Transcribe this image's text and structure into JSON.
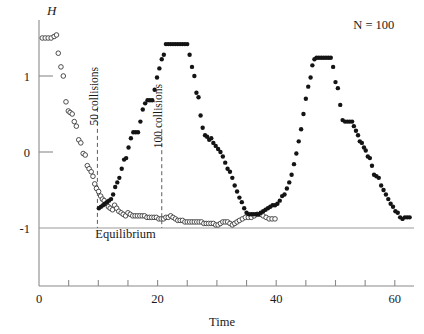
{
  "figure": {
    "y_axis_label": "H",
    "x_axis_label": "Time",
    "legend_note": "N = 100",
    "equilibrium_label": "Equilibrium",
    "annotation_1": "50 collisions",
    "annotation_2": "100 collisions"
  },
  "colors": {
    "axis": "#8a8a8a",
    "filled_marker": "#141414",
    "open_marker_stroke": "#3a3a3a",
    "open_marker_fill": "#ffffff",
    "equilibrium_line": "#9a9a9a",
    "annotation_line": "#4a4a4a",
    "background": "#ffffff"
  },
  "chart_data": {
    "type": "scatter",
    "title": "",
    "subtitle": "",
    "xlabel": "Time",
    "ylabel": "H",
    "xlim": [
      0,
      64
    ],
    "ylim": [
      -1.35,
      1.75
    ],
    "grid": false,
    "legend_position": "top-right",
    "annotations": [
      {
        "text": "N = 100",
        "x": 53,
        "y": 1.62,
        "kind": "note"
      },
      {
        "text": "Equilibrium",
        "x": 9.5,
        "y": -1.13,
        "kind": "label"
      },
      {
        "text": "50 collisions",
        "x": 10.0,
        "y": 0.35,
        "kind": "vline-label",
        "rotation": -90
      },
      {
        "text": "100 collisions",
        "x": 20.8,
        "y": 0.05,
        "kind": "vline-label",
        "rotation": -90
      }
    ],
    "reference_lines": [
      {
        "name": "equilibrium",
        "orientation": "horizontal",
        "value": -1.0,
        "style": "solid"
      },
      {
        "name": "50 collisions",
        "orientation": "vertical",
        "value": 9.85,
        "style": "dashed",
        "y_from": -1.0,
        "y_to": 0.58
      },
      {
        "name": "100 collisions",
        "orientation": "vertical",
        "value": 20.7,
        "style": "dashed",
        "y_from": -1.0,
        "y_to": 0.3
      }
    ],
    "x_ticks": [
      0,
      5,
      10,
      15,
      20,
      25,
      30,
      35,
      40,
      45,
      50,
      55,
      60
    ],
    "x_tick_labels": {
      "0": "0",
      "20": "20",
      "40": "40",
      "60": "60"
    },
    "y_ticks": [
      -1,
      0,
      1
    ],
    "y_tick_labels": {
      "-1": "-1",
      "0": "0",
      "1": "1"
    },
    "series": [
      {
        "name": "open-circles",
        "marker": "open-circle",
        "points": [
          [
            0.55,
            1.5
          ],
          [
            1.05,
            1.5
          ],
          [
            1.55,
            1.5
          ],
          [
            2.05,
            1.5
          ],
          [
            2.55,
            1.52
          ],
          [
            2.95,
            1.54
          ],
          [
            3.25,
            1.3
          ],
          [
            3.7,
            1.12
          ],
          [
            4.1,
            1.0
          ],
          [
            4.55,
            0.66
          ],
          [
            4.95,
            0.54
          ],
          [
            5.25,
            0.52
          ],
          [
            5.6,
            0.5
          ],
          [
            5.95,
            0.4
          ],
          [
            6.3,
            0.34
          ],
          [
            6.7,
            0.16
          ],
          [
            7.05,
            0.12
          ],
          [
            7.45,
            -0.02
          ],
          [
            7.8,
            -0.04
          ],
          [
            8.15,
            -0.18
          ],
          [
            8.45,
            -0.22
          ],
          [
            8.8,
            -0.26
          ],
          [
            9.1,
            -0.32
          ],
          [
            9.4,
            -0.42
          ],
          [
            9.7,
            -0.48
          ],
          [
            10.05,
            -0.52
          ],
          [
            10.4,
            -0.58
          ],
          [
            10.7,
            -0.62
          ],
          [
            11.0,
            -0.64
          ],
          [
            11.35,
            -0.68
          ],
          [
            11.7,
            -0.72
          ],
          [
            12.0,
            -0.74
          ],
          [
            12.4,
            -0.76
          ],
          [
            12.75,
            -0.7
          ],
          [
            13.1,
            -0.74
          ],
          [
            13.45,
            -0.78
          ],
          [
            13.85,
            -0.8
          ],
          [
            14.2,
            -0.82
          ],
          [
            14.6,
            -0.84
          ],
          [
            15.0,
            -0.8
          ],
          [
            15.4,
            -0.82
          ],
          [
            15.8,
            -0.84
          ],
          [
            16.2,
            -0.84
          ],
          [
            16.6,
            -0.84
          ],
          [
            17.0,
            -0.84
          ],
          [
            17.4,
            -0.84
          ],
          [
            17.8,
            -0.84
          ],
          [
            18.2,
            -0.86
          ],
          [
            18.6,
            -0.86
          ],
          [
            19.0,
            -0.86
          ],
          [
            19.4,
            -0.86
          ],
          [
            19.8,
            -0.86
          ],
          [
            20.2,
            -0.88
          ],
          [
            20.6,
            -0.88
          ],
          [
            21.0,
            -0.88
          ],
          [
            21.4,
            -0.86
          ],
          [
            21.8,
            -0.86
          ],
          [
            22.2,
            -0.84
          ],
          [
            22.6,
            -0.86
          ],
          [
            23.0,
            -0.88
          ],
          [
            23.4,
            -0.9
          ],
          [
            23.8,
            -0.9
          ],
          [
            24.2,
            -0.9
          ],
          [
            24.6,
            -0.92
          ],
          [
            25.0,
            -0.92
          ],
          [
            25.4,
            -0.92
          ],
          [
            25.8,
            -0.92
          ],
          [
            26.2,
            -0.92
          ],
          [
            26.6,
            -0.92
          ],
          [
            27.0,
            -0.92
          ],
          [
            27.4,
            -0.92
          ],
          [
            27.8,
            -0.94
          ],
          [
            28.2,
            -0.94
          ],
          [
            28.6,
            -0.94
          ],
          [
            29.0,
            -0.94
          ],
          [
            29.4,
            -0.94
          ],
          [
            29.8,
            -0.96
          ],
          [
            30.2,
            -0.96
          ],
          [
            30.6,
            -0.94
          ],
          [
            31.0,
            -0.92
          ],
          [
            31.4,
            -0.92
          ],
          [
            31.8,
            -0.92
          ],
          [
            32.2,
            -0.94
          ],
          [
            32.6,
            -0.96
          ],
          [
            33.0,
            -0.94
          ],
          [
            33.4,
            -0.92
          ],
          [
            33.8,
            -0.9
          ],
          [
            34.3,
            -0.88
          ],
          [
            34.8,
            -0.86
          ],
          [
            35.3,
            -0.86
          ],
          [
            35.8,
            -0.86
          ],
          [
            36.3,
            -0.84
          ],
          [
            36.8,
            -0.82
          ],
          [
            37.3,
            -0.82
          ],
          [
            37.8,
            -0.84
          ],
          [
            38.3,
            -0.86
          ],
          [
            38.8,
            -0.88
          ],
          [
            39.3,
            -0.88
          ],
          [
            39.8,
            -0.88
          ]
        ]
      },
      {
        "name": "filled-circles",
        "marker": "filled-circle",
        "points": [
          [
            10.1,
            -0.74
          ],
          [
            10.45,
            -0.72
          ],
          [
            10.8,
            -0.7
          ],
          [
            11.1,
            -0.68
          ],
          [
            11.45,
            -0.66
          ],
          [
            11.8,
            -0.64
          ],
          [
            12.15,
            -0.62
          ],
          [
            12.5,
            -0.56
          ],
          [
            12.85,
            -0.46
          ],
          [
            13.2,
            -0.4
          ],
          [
            13.55,
            -0.34
          ],
          [
            13.95,
            -0.22
          ],
          [
            14.35,
            -0.1
          ],
          [
            14.7,
            -0.08
          ],
          [
            15.1,
            0.06
          ],
          [
            15.5,
            0.18
          ],
          [
            15.9,
            0.26
          ],
          [
            16.3,
            0.26
          ],
          [
            16.7,
            0.26
          ],
          [
            17.1,
            0.4
          ],
          [
            17.5,
            0.56
          ],
          [
            17.9,
            0.64
          ],
          [
            18.3,
            0.68
          ],
          [
            18.7,
            0.68
          ],
          [
            19.1,
            0.68
          ],
          [
            19.5,
            0.82
          ],
          [
            19.9,
            0.98
          ],
          [
            20.3,
            1.1
          ],
          [
            20.7,
            1.22
          ],
          [
            21.05,
            1.28
          ],
          [
            21.4,
            1.42
          ],
          [
            21.8,
            1.42
          ],
          [
            22.2,
            1.42
          ],
          [
            22.6,
            1.42
          ],
          [
            23.0,
            1.42
          ],
          [
            23.4,
            1.42
          ],
          [
            23.8,
            1.42
          ],
          [
            24.2,
            1.42
          ],
          [
            24.6,
            1.42
          ],
          [
            25.0,
            1.42
          ],
          [
            25.4,
            1.28
          ],
          [
            25.8,
            1.12
          ],
          [
            26.2,
            1.0
          ],
          [
            26.55,
            0.78
          ],
          [
            26.9,
            0.72
          ],
          [
            27.25,
            0.48
          ],
          [
            27.6,
            0.32
          ],
          [
            28.0,
            0.22
          ],
          [
            28.35,
            0.2
          ],
          [
            28.7,
            0.16
          ],
          [
            29.05,
            0.18
          ],
          [
            29.4,
            0.12
          ],
          [
            29.8,
            0.08
          ],
          [
            30.2,
            0.04
          ],
          [
            30.6,
            0.0
          ],
          [
            31.0,
            -0.06
          ],
          [
            31.4,
            -0.14
          ],
          [
            31.8,
            -0.22
          ],
          [
            32.2,
            -0.26
          ],
          [
            32.6,
            -0.34
          ],
          [
            33.0,
            -0.44
          ],
          [
            33.4,
            -0.52
          ],
          [
            33.8,
            -0.6
          ],
          [
            34.2,
            -0.66
          ],
          [
            34.6,
            -0.74
          ],
          [
            35.0,
            -0.8
          ],
          [
            35.4,
            -0.82
          ],
          [
            35.8,
            -0.82
          ],
          [
            36.2,
            -0.82
          ],
          [
            36.6,
            -0.82
          ],
          [
            37.0,
            -0.82
          ],
          [
            37.4,
            -0.8
          ],
          [
            37.8,
            -0.78
          ],
          [
            38.2,
            -0.76
          ],
          [
            38.6,
            -0.74
          ],
          [
            39.0,
            -0.72
          ],
          [
            39.4,
            -0.7
          ],
          [
            39.8,
            -0.7
          ],
          [
            40.2,
            -0.68
          ],
          [
            40.6,
            -0.64
          ],
          [
            41.0,
            -0.58
          ],
          [
            41.4,
            -0.56
          ],
          [
            41.8,
            -0.48
          ],
          [
            42.2,
            -0.4
          ],
          [
            42.6,
            -0.3
          ],
          [
            43.0,
            -0.16
          ],
          [
            43.4,
            -0.02
          ],
          [
            43.8,
            0.14
          ],
          [
            44.2,
            0.3
          ],
          [
            44.6,
            0.5
          ],
          [
            45.0,
            0.7
          ],
          [
            45.4,
            0.86
          ],
          [
            45.8,
            0.98
          ],
          [
            46.1,
            1.14
          ],
          [
            46.45,
            1.22
          ],
          [
            46.8,
            1.24
          ],
          [
            47.2,
            1.24
          ],
          [
            47.6,
            1.24
          ],
          [
            48.0,
            1.24
          ],
          [
            48.4,
            1.24
          ],
          [
            48.8,
            1.24
          ],
          [
            49.2,
            1.24
          ],
          [
            49.6,
            1.12
          ],
          [
            50.0,
            0.92
          ],
          [
            50.4,
            0.84
          ],
          [
            50.8,
            0.62
          ],
          [
            51.2,
            0.42
          ],
          [
            51.6,
            0.4
          ],
          [
            52.0,
            0.4
          ],
          [
            52.4,
            0.4
          ],
          [
            52.8,
            0.4
          ],
          [
            53.1,
            0.34
          ],
          [
            53.45,
            0.28
          ],
          [
            53.8,
            0.22
          ],
          [
            54.1,
            0.14
          ],
          [
            54.45,
            0.12
          ],
          [
            54.8,
            0.06
          ],
          [
            55.1,
            0.02
          ],
          [
            55.45,
            -0.06
          ],
          [
            55.8,
            -0.08
          ],
          [
            56.15,
            -0.18
          ],
          [
            56.5,
            -0.3
          ],
          [
            56.9,
            -0.32
          ],
          [
            57.3,
            -0.34
          ],
          [
            57.7,
            -0.44
          ],
          [
            58.1,
            -0.5
          ],
          [
            58.5,
            -0.56
          ],
          [
            58.9,
            -0.62
          ],
          [
            59.3,
            -0.68
          ],
          [
            59.7,
            -0.72
          ],
          [
            60.1,
            -0.78
          ],
          [
            60.5,
            -0.8
          ],
          [
            60.9,
            -0.86
          ],
          [
            61.3,
            -0.88
          ],
          [
            61.7,
            -0.86
          ],
          [
            62.1,
            -0.86
          ],
          [
            62.5,
            -0.86
          ]
        ]
      }
    ]
  }
}
